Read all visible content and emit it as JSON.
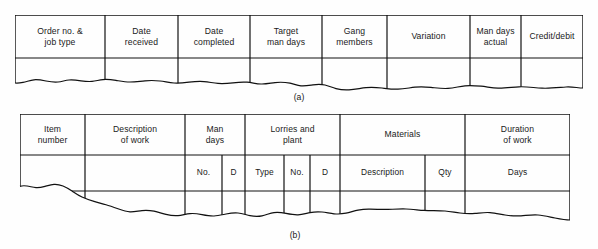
{
  "document": {
    "type": "figure",
    "description": "Two torn-paper record sheet layouts showing column headings"
  },
  "colors": {
    "background": "#fefefe",
    "rule": "#111111",
    "text": "#1a1a1a"
  },
  "figures": [
    {
      "id": "figure-a",
      "caption": "(a)",
      "columns": [
        {
          "label": "Order no. &\njob type"
        },
        {
          "label": "Date\nreceived"
        },
        {
          "label": "Date\ncompleted"
        },
        {
          "label": "Target\nman days"
        },
        {
          "label": "Gang\nmembers"
        },
        {
          "label": "Variation"
        },
        {
          "label": "Man days\nactual"
        },
        {
          "label": "Credit/debit"
        }
      ]
    },
    {
      "id": "figure-b",
      "caption": "(b)",
      "groups": [
        {
          "label": "Item\nnumber",
          "sub": []
        },
        {
          "label": "Description\nof work",
          "sub": []
        },
        {
          "label": "Man\ndays",
          "sub": [
            {
              "label": "No."
            },
            {
              "label": "D"
            }
          ]
        },
        {
          "label": "Lorries and\nplant",
          "sub": [
            {
              "label": "Type"
            },
            {
              "label": "No."
            },
            {
              "label": "D"
            }
          ]
        },
        {
          "label": "Materials",
          "sub": [
            {
              "label": "Description"
            },
            {
              "label": "Qty"
            }
          ]
        },
        {
          "label": "Duration\nof work",
          "sub": [
            {
              "label": "Days"
            }
          ]
        }
      ]
    }
  ]
}
